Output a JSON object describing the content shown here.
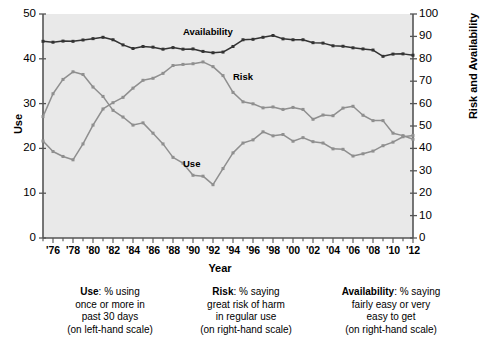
{
  "chart_data": {
    "type": "line",
    "title": "",
    "xlabel": "Year",
    "ylabel_left": "Use",
    "ylabel_right": "Risk and Availability",
    "grid": false,
    "legend_position": "inline-annotations",
    "ylim_left": [
      0,
      50
    ],
    "ylim_right": [
      0,
      100
    ],
    "yticks_left": [
      "50",
      "40",
      "30",
      "20",
      "10",
      "0"
    ],
    "yticks_right": [
      "100",
      "90",
      "80",
      "70",
      "60",
      "50",
      "40",
      "30",
      "20",
      "10",
      "0"
    ],
    "xlim": [
      1975,
      2012
    ],
    "x": [
      1975,
      1976,
      1977,
      1978,
      1979,
      1980,
      1981,
      1982,
      1983,
      1984,
      1985,
      1986,
      1987,
      1988,
      1989,
      1990,
      1991,
      1992,
      1993,
      1994,
      1995,
      1996,
      1997,
      1998,
      1999,
      2000,
      2001,
      2002,
      2003,
      2004,
      2005,
      2006,
      2007,
      2008,
      2009,
      2010,
      2011,
      2012
    ],
    "xtick_labels": [
      "'76",
      "'78",
      "'80",
      "'82",
      "'84",
      "'86",
      "'88",
      "'90",
      "'92",
      "'94",
      "'96",
      "'98",
      "'00",
      "'02",
      "'04",
      "'06",
      "'08",
      "'10",
      "'12"
    ],
    "xtick_values": [
      1976,
      1978,
      1980,
      1982,
      1984,
      1986,
      1988,
      1990,
      1992,
      1994,
      1996,
      1998,
      2000,
      2002,
      2004,
      2006,
      2008,
      2010,
      2012
    ],
    "series": [
      {
        "name": "Availability",
        "axis": "right",
        "color": "#333333",
        "label_x": 1989,
        "label_y": 92,
        "values": [
          87.8,
          87.4,
          87.9,
          87.8,
          88.4,
          89.0,
          89.6,
          88.5,
          86.2,
          84.6,
          85.5,
          85.2,
          84.3,
          85.0,
          84.3,
          84.4,
          83.3,
          82.7,
          83.0,
          85.5,
          88.5,
          88.7,
          89.6,
          90.4,
          88.9,
          88.5,
          88.5,
          87.2,
          87.0,
          85.8,
          85.6,
          84.9,
          84.4,
          83.9,
          81.1,
          82.1,
          82.2,
          81.6
        ]
      },
      {
        "name": "Risk",
        "axis": "right",
        "color": "#8f8f8f",
        "label_x": 1994,
        "label_y": 72,
        "values": [
          43.3,
          38.6,
          36.4,
          34.9,
          42.0,
          50.4,
          57.6,
          60.4,
          62.8,
          66.9,
          70.4,
          71.3,
          73.5,
          77.0,
          77.5,
          77.8,
          78.6,
          76.5,
          72.5,
          65.0,
          60.8,
          59.9,
          58.1,
          58.5,
          57.4,
          58.3,
          57.4,
          53.0,
          54.9,
          54.6,
          58.0,
          58.8,
          54.8,
          52.4,
          52.4,
          46.8,
          45.7,
          44.1
        ]
      },
      {
        "name": "Use",
        "axis": "left",
        "color": "#8f8f8f",
        "label_x": 1989,
        "label_y": 16.5,
        "values": [
          27.1,
          32.2,
          35.4,
          37.1,
          36.5,
          33.7,
          31.6,
          28.5,
          27.0,
          25.2,
          25.7,
          23.4,
          21.0,
          18.0,
          16.7,
          14.0,
          13.8,
          11.9,
          15.5,
          19.0,
          21.2,
          21.9,
          23.7,
          22.8,
          23.1,
          21.6,
          22.4,
          21.5,
          21.2,
          19.9,
          19.8,
          18.3,
          18.8,
          19.4,
          20.6,
          21.4,
          22.6,
          22.9
        ]
      }
    ],
    "captions": [
      {
        "bold": "Use",
        "rest": ": % using",
        "lines": [
          "once or more in",
          "past 30 days",
          "(on left-hand scale)"
        ]
      },
      {
        "bold": "Risk",
        "rest": ": % saying",
        "lines": [
          "great risk of harm",
          "in regular use",
          "(on right-hand scale)"
        ]
      },
      {
        "bold": "Availability",
        "rest": ": % saying",
        "lines": [
          "fairly easy or very",
          "easy to get",
          "(on right-hand scale)"
        ]
      }
    ],
    "plot_bg": "#e9e9e9",
    "axis_color": "#555555"
  }
}
